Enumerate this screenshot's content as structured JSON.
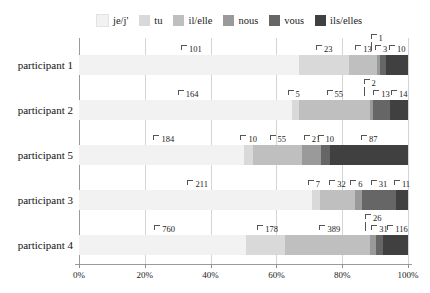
{
  "chart_data": {
    "type": "bar",
    "subtype": "stacked-horizontal-100-percent",
    "title": "",
    "xlabel": "",
    "ylabel": "",
    "xlim": [
      0,
      100
    ],
    "xticks": [
      "0%",
      "20%",
      "40%",
      "60%",
      "80%",
      "100%"
    ],
    "xtick_values": [
      0,
      20,
      40,
      60,
      80,
      100
    ],
    "grid": true,
    "legend_position": "top",
    "categories": [
      "participant 1",
      "participant 2",
      "participant 5",
      "participant 3",
      "participant 4"
    ],
    "series": [
      {
        "name": "je/j'",
        "color": "#f2f2f2",
        "values": [
          101,
          164,
          184,
          211,
          760
        ]
      },
      {
        "name": "tu",
        "color": "#d9d9d9",
        "values": [
          23,
          5,
          10,
          7,
          178
        ]
      },
      {
        "name": "il/elle",
        "color": "#bfbfbf",
        "values": [
          13,
          55,
          55,
          32,
          389
        ]
      },
      {
        "name": "nous",
        "color": "#9a9a9a",
        "values": [
          1,
          2,
          21,
          6,
          26
        ]
      },
      {
        "name": "vous",
        "color": "#666666",
        "values": [
          3,
          13,
          10,
          31,
          31
        ]
      },
      {
        "name": "ils/elles",
        "color": "#404040",
        "values": [
          10,
          14,
          87,
          11,
          116
        ]
      }
    ],
    "row_totals": [
      151,
      253,
      367,
      298,
      1500
    ]
  },
  "legend": {
    "items": [
      {
        "label": "je/j'",
        "color": "#f2f2f2"
      },
      {
        "label": "tu",
        "color": "#d9d9d9"
      },
      {
        "label": "il/elle",
        "color": "#bfbfbf"
      },
      {
        "label": "nous",
        "color": "#9a9a9a"
      },
      {
        "label": "vous",
        "color": "#666666"
      },
      {
        "label": "ils/elles",
        "color": "#404040"
      }
    ]
  },
  "axis": {
    "x_tick_labels": [
      "0%",
      "20%",
      "40%",
      "60%",
      "80%",
      "100%"
    ],
    "y_tick_labels": [
      "participant 1",
      "participant 2",
      "participant 5",
      "participant 3",
      "participant 4"
    ]
  },
  "colors": {
    "axis": "#9a9a9a",
    "grid": "#d4d4d4",
    "text": "#1a1a1a",
    "background": "#ffffff"
  }
}
